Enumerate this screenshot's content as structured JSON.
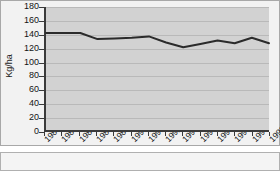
{
  "chart_data": {
    "type": "line",
    "title": "",
    "xlabel": "",
    "ylabel": "Kg/ha",
    "ylim": [
      0,
      180
    ],
    "yticks": [
      0,
      20,
      40,
      60,
      80,
      100,
      120,
      140,
      160,
      180
    ],
    "grid": true,
    "legend": false,
    "categories": [
      "1985",
      "1986",
      "1987",
      "1988",
      "1989",
      "1990",
      "1991",
      "1992",
      "1993",
      "1994",
      "1995",
      "1996",
      "1997",
      "1998"
    ],
    "values": [
      142,
      142,
      142,
      133,
      134,
      135,
      137,
      128,
      121,
      126,
      131,
      127,
      135,
      127
    ],
    "series": [
      {
        "name": "Kg/ha",
        "values": [
          142,
          142,
          142,
          133,
          134,
          135,
          137,
          128,
          121,
          126,
          131,
          127,
          135,
          127
        ],
        "color": "#2b2b2b"
      }
    ]
  },
  "axis": {
    "y_title": "Kg/ha",
    "y_tick_labels": [
      "180",
      "160",
      "140",
      "120",
      "100",
      "80",
      "60",
      "40",
      "20",
      "0"
    ],
    "x_tick_labels": [
      "1985",
      "1986",
      "1987",
      "1988",
      "1989",
      "1990",
      "1991",
      "1992",
      "1993",
      "1994",
      "1995",
      "1996",
      "1997",
      "1998"
    ]
  },
  "colors": {
    "line": "#2b2b2b",
    "plot_background": "#d2d2d2",
    "panel_background": "#f2f2f2",
    "gridline": "#b9b9b9",
    "axis": "#3a3a3a"
  }
}
